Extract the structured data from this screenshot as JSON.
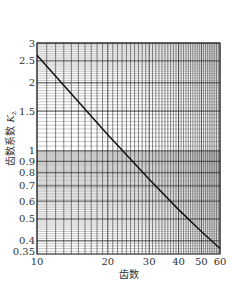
{
  "chart_data": {
    "type": "line",
    "title": "",
    "xlabel": "齿数",
    "ylabel": "齿数系数 Kz",
    "xscale": "log",
    "yscale": "log",
    "xlim": [
      10,
      60
    ],
    "ylim": [
      0.35,
      3
    ],
    "x_ticks": [
      "10",
      "20",
      "30",
      "40",
      "50",
      "60"
    ],
    "y_ticks": [
      "0.35",
      "0.4",
      "0.5",
      "0.6",
      "0.7",
      "0.8",
      "0.9",
      "1",
      "1.5",
      "2",
      "2.5",
      "3"
    ],
    "grid": true,
    "series": [
      {
        "name": "Kz",
        "x": [
          10,
          20,
          30,
          40,
          50,
          60
        ],
        "y": [
          2.65,
          1.18,
          0.75,
          0.55,
          0.44,
          0.37
        ]
      }
    ]
  },
  "axis": {
    "xlabel": "齿数",
    "ylabel_main": "齿数系数",
    "ylabel_sym": "K",
    "ylabel_sub": "z"
  }
}
